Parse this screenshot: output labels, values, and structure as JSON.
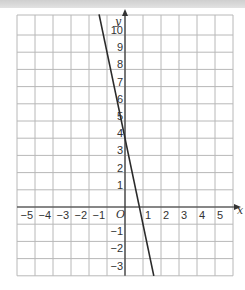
{
  "chart_data": {
    "type": "line",
    "title": "",
    "xlabel": "x",
    "ylabel": "y",
    "origin_label": "O",
    "xlim": [
      -6,
      6
    ],
    "ylim": [
      -4,
      11.2
    ],
    "grid": true,
    "x_ticks": [
      -5,
      -4,
      -3,
      -2,
      -1,
      1,
      2,
      3,
      4,
      5
    ],
    "y_ticks": [
      -3,
      -2,
      -1,
      1,
      2,
      3,
      4,
      5,
      6,
      7,
      8,
      9,
      10
    ],
    "x_tick_labels": [
      "−5",
      "−4",
      "−3",
      "−2",
      "−1",
      "1",
      "2",
      "3",
      "4",
      "5"
    ],
    "y_tick_labels": [
      "−3",
      "−2",
      "−1",
      "1",
      "2",
      "3",
      "4",
      "5",
      "6",
      "7",
      "8",
      "9",
      "10"
    ],
    "series": [
      {
        "name": "y = 4 − 5x",
        "slope": -5,
        "intercept": 4,
        "x": [
          -1.44,
          1.6
        ],
        "y": [
          11.2,
          -4
        ],
        "color": "#333333"
      }
    ],
    "colors": {
      "grid": "#b8b8b8",
      "axis": "#333333",
      "line": "#2a2a2a"
    }
  }
}
